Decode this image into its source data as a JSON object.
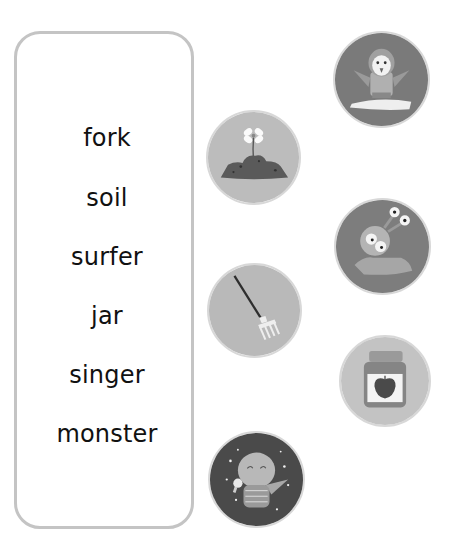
{
  "words": [
    "fork",
    "soil",
    "surfer",
    "jar",
    "singer",
    "monster"
  ],
  "pictures": [
    {
      "name": "surfer-picture",
      "depicts": "bird on surfboard",
      "bg": "#7a7a7a"
    },
    {
      "name": "soil-picture",
      "depicts": "flower in soil mound",
      "bg": "#bcbcbc"
    },
    {
      "name": "monster-picture",
      "depicts": "monster with eye stalks",
      "bg": "#7d7d7d"
    },
    {
      "name": "fork-picture",
      "depicts": "garden fork",
      "bg": "#b9b9b9"
    },
    {
      "name": "jar-picture",
      "depicts": "jam jar with strawberry label",
      "bg": "#c3c3c3"
    },
    {
      "name": "singer-picture",
      "depicts": "bird singing into microphone",
      "bg": "#4a4a4a"
    }
  ]
}
